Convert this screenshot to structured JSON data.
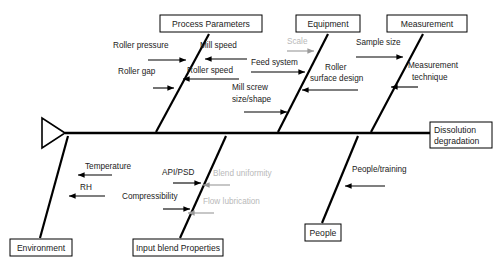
{
  "diagram": {
    "type": "fishbone-ishikawa",
    "title_effect": "Dissolution degradation",
    "background_color": "#ffffff",
    "line_color": "#000000",
    "faded_text_color": "#b9b9b9",
    "text_color": "#222222"
  },
  "effect": {
    "line1": "Dissolution",
    "line2": "degradation"
  },
  "categories": [
    {
      "name": "process-parameters",
      "label": "Process Parameters",
      "side": "top",
      "box": {
        "x": 160,
        "y": 15,
        "w": 102,
        "h": 17
      },
      "branch": {
        "x1": 209,
        "y1": 34,
        "x2": 156,
        "y2": 132
      },
      "causes": [
        {
          "label": "Roller pressure",
          "faded": false,
          "tx": 113,
          "ty": 48,
          "anchor": "start",
          "ax1": 148,
          "ay1": 60,
          "ax2": 186,
          "ay2": 60,
          "dir": "right"
        },
        {
          "label": "Mill speed",
          "faded": false,
          "tx": 200,
          "ty": 48,
          "anchor": "start",
          "ax1": 247,
          "ay1": 59,
          "ax2": 205,
          "ay2": 59,
          "dir": "left"
        },
        {
          "label": "Roller gap",
          "faded": false,
          "tx": 118,
          "ty": 74,
          "anchor": "start",
          "ax1": 153,
          "ay1": 88,
          "ax2": 174,
          "ay2": 88,
          "dir": "right"
        },
        {
          "label": "Roller speed",
          "faded": false,
          "tx": 187,
          "ty": 73,
          "anchor": "start",
          "ax1": 239,
          "ay1": 79,
          "ax2": 183,
          "ay2": 79,
          "dir": "left"
        }
      ]
    },
    {
      "name": "equipment",
      "label": "Equipment",
      "side": "top",
      "box": {
        "x": 296,
        "y": 15,
        "w": 64,
        "h": 17
      },
      "branch": {
        "x1": 328,
        "y1": 34,
        "x2": 278,
        "y2": 132
      },
      "causes": [
        {
          "label": "Scale",
          "faded": true,
          "tx": 287,
          "ty": 44,
          "anchor": "start",
          "ax1": 287,
          "ay1": 51,
          "ax2": 314,
          "ay2": 51,
          "dir": "right"
        },
        {
          "label": "Feed system",
          "faded": false,
          "tx": 251,
          "ty": 65,
          "anchor": "start",
          "ax1": 251,
          "ay1": 72,
          "ax2": 305,
          "ay2": 72,
          "dir": "right"
        },
        {
          "label": "Roller",
          "faded": false,
          "tx": 325,
          "ty": 70,
          "anchor": "start",
          "ax1": 358,
          "ay1": 90,
          "ax2": 302,
          "ay2": 90,
          "dir": "left"
        },
        {
          "label": "surface design",
          "faded": false,
          "tx": 310,
          "ty": 81,
          "anchor": "start",
          "ax1": 0,
          "ay1": 0,
          "ax2": 0,
          "ay2": 0,
          "dir": "none"
        },
        {
          "label": "Mill screw",
          "faded": false,
          "tx": 232,
          "ty": 90,
          "anchor": "start",
          "ax1": 0,
          "ay1": 0,
          "ax2": 0,
          "ay2": 0,
          "dir": "none"
        },
        {
          "label": "size/shape",
          "faded": false,
          "tx": 232,
          "ty": 102,
          "anchor": "start",
          "ax1": 244,
          "ay1": 112,
          "ax2": 287,
          "ay2": 112,
          "dir": "right"
        }
      ]
    },
    {
      "name": "measurement",
      "label": "Measurement",
      "side": "top",
      "box": {
        "x": 387,
        "y": 15,
        "w": 80,
        "h": 17
      },
      "branch": {
        "x1": 423,
        "y1": 34,
        "x2": 371,
        "y2": 132
      },
      "causes": [
        {
          "label": "Sample size",
          "faded": false,
          "tx": 356,
          "ty": 45,
          "anchor": "start",
          "ax1": 356,
          "ay1": 57,
          "ax2": 403,
          "ay2": 57,
          "dir": "right"
        },
        {
          "label": "Measurement",
          "faded": false,
          "tx": 408,
          "ty": 68,
          "anchor": "start",
          "ax1": 0,
          "ay1": 0,
          "ax2": 0,
          "ay2": 0,
          "dir": "none"
        },
        {
          "label": "technique",
          "faded": false,
          "tx": 412,
          "ty": 80,
          "anchor": "start",
          "ax1": 418,
          "ay1": 87,
          "ax2": 391,
          "ay2": 87,
          "dir": "left"
        }
      ]
    },
    {
      "name": "environment",
      "label": "Environment",
      "side": "bottom",
      "box": {
        "x": 10,
        "y": 239,
        "w": 62,
        "h": 17
      },
      "branch": {
        "x1": 40,
        "y1": 238,
        "x2": 68,
        "y2": 136
      },
      "causes": [
        {
          "label": "Temperature",
          "faded": false,
          "tx": 85,
          "ty": 169,
          "anchor": "start",
          "ax1": 112,
          "ay1": 175,
          "ax2": 78,
          "ay2": 175,
          "dir": "left"
        },
        {
          "label": "RH",
          "faded": false,
          "tx": 80,
          "ty": 190,
          "anchor": "start",
          "ax1": 105,
          "ay1": 196,
          "ax2": 69,
          "ay2": 196,
          "dir": "left"
        }
      ]
    },
    {
      "name": "input-blend-properties",
      "label": "Input blend Properties",
      "side": "bottom",
      "box": {
        "x": 133,
        "y": 239,
        "w": 90,
        "h": 17
      },
      "branch": {
        "x1": 180,
        "y1": 238,
        "x2": 226,
        "y2": 136
      },
      "causes": [
        {
          "label": "API/PSD",
          "faded": false,
          "tx": 162,
          "ty": 175,
          "anchor": "start",
          "ax1": 173,
          "ay1": 183,
          "ax2": 201,
          "ay2": 183,
          "dir": "right"
        },
        {
          "label": "Blend uniformity",
          "faded": true,
          "tx": 213,
          "ty": 176,
          "anchor": "start",
          "ax1": 230,
          "ay1": 185,
          "ax2": 203,
          "ay2": 185,
          "dir": "left"
        },
        {
          "label": "Compressibility",
          "faded": false,
          "tx": 122,
          "ty": 199,
          "anchor": "start",
          "ax1": 163,
          "ay1": 209,
          "ax2": 190,
          "ay2": 209,
          "dir": "right"
        },
        {
          "label": "Flow lubrication",
          "faded": true,
          "tx": 203,
          "ty": 204,
          "anchor": "start",
          "ax1": 214,
          "ay1": 213,
          "ax2": 188,
          "ay2": 213,
          "dir": "left"
        }
      ]
    },
    {
      "name": "people",
      "label": "People",
      "side": "bottom",
      "box": {
        "x": 305,
        "y": 224,
        "w": 36,
        "h": 17
      },
      "branch": {
        "x1": 322,
        "y1": 223,
        "x2": 358,
        "y2": 136
      },
      "causes": [
        {
          "label": "People/training",
          "faded": false,
          "tx": 352,
          "ty": 172,
          "anchor": "start",
          "ax1": 385,
          "ay1": 186,
          "ax2": 345,
          "ay2": 186,
          "dir": "left"
        }
      ]
    }
  ],
  "spine": {
    "y": 133,
    "x_start": 65,
    "x_end": 423,
    "tail_triangle": {
      "x_tip": 65,
      "x_base": 42,
      "y_top": 118,
      "y_bottom": 148
    }
  }
}
